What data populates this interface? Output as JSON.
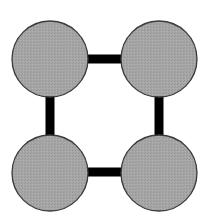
{
  "diagram": {
    "type": "graph",
    "colors": {
      "node_fill": "#a3a3a3",
      "node_stroke": "#3a3a3a",
      "edge": "#000000",
      "background": "#ffffff"
    },
    "nodes": [
      {
        "id": "top-left",
        "cx": 50,
        "cy": 59,
        "r": 38
      },
      {
        "id": "top-right",
        "cx": 159,
        "cy": 59,
        "r": 38
      },
      {
        "id": "bottom-left",
        "cx": 50,
        "cy": 173,
        "r": 38
      },
      {
        "id": "bottom-right",
        "cx": 159,
        "cy": 173,
        "r": 38
      }
    ],
    "edges": [
      {
        "id": "top",
        "from": "top-left",
        "to": "top-right",
        "x1": 87,
        "y1": 59,
        "x2": 122,
        "y2": 59,
        "width": 9
      },
      {
        "id": "bottom",
        "from": "bottom-left",
        "to": "bottom-right",
        "x1": 87,
        "y1": 172,
        "x2": 122,
        "y2": 172,
        "width": 9
      },
      {
        "id": "left",
        "from": "top-left",
        "to": "bottom-left",
        "x1": 50,
        "y1": 97,
        "x2": 50,
        "y2": 135,
        "width": 9
      },
      {
        "id": "right",
        "from": "top-right",
        "to": "bottom-right",
        "x1": 159,
        "y1": 97,
        "x2": 159,
        "y2": 135,
        "width": 9
      }
    ]
  }
}
